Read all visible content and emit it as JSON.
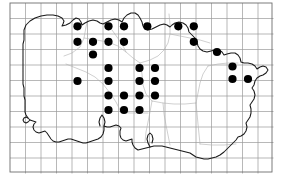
{
  "figure": {
    "kind": "distribution-map",
    "region": "Jersey",
    "width": 283,
    "height": 183,
    "background_color": "#ffffff"
  },
  "chart_data": {
    "type": "scatter",
    "title": "",
    "subtitle": "",
    "xlabel": "",
    "ylabel": "",
    "grid": true,
    "legend_position": "none",
    "marker": {
      "shape": "circle",
      "fill_color": "#000000",
      "radius_px": 4.1,
      "count": 36
    },
    "grid_spec": {
      "origin_x": 10,
      "origin_y": 3,
      "cell_size": 15.5,
      "columns": 17,
      "rows": 11,
      "line_color": "#9a9a9a",
      "border_color": "#6e6e6e"
    },
    "axis_ranges": {
      "xlim": [
        0,
        17
      ],
      "ylim": [
        0,
        11
      ]
    },
    "tick_labels": {
      "x": [],
      "y": []
    },
    "annotations": [],
    "records_grid_cells": [
      [
        4,
        1
      ],
      [
        6,
        1
      ],
      [
        7,
        1
      ],
      [
        9,
        1
      ],
      [
        11,
        1
      ],
      [
        12,
        1
      ],
      [
        4,
        2
      ],
      [
        5,
        2
      ],
      [
        6,
        2
      ],
      [
        7,
        2
      ],
      [
        12,
        2
      ],
      [
        5,
        3
      ],
      [
        14,
        3
      ],
      [
        6,
        4
      ],
      [
        8,
        4
      ],
      [
        9,
        4
      ],
      [
        15,
        4
      ],
      [
        4,
        5
      ],
      [
        6,
        5
      ],
      [
        8,
        5
      ],
      [
        9,
        5
      ],
      [
        15,
        5
      ],
      [
        16,
        5
      ],
      [
        6,
        6
      ],
      [
        7,
        6
      ],
      [
        8,
        6
      ],
      [
        9,
        6
      ],
      [
        6,
        7
      ],
      [
        7,
        7
      ],
      [
        8,
        7
      ]
    ],
    "points_px": [
      {
        "x": 77.5,
        "y": 26.3
      },
      {
        "x": 108.5,
        "y": 26.3
      },
      {
        "x": 124.0,
        "y": 26.3
      },
      {
        "x": 147.3,
        "y": 26.3
      },
      {
        "x": 178.3,
        "y": 26.3
      },
      {
        "x": 193.8,
        "y": 26.3
      },
      {
        "x": 77.5,
        "y": 41.8
      },
      {
        "x": 93.0,
        "y": 41.8
      },
      {
        "x": 108.5,
        "y": 41.8
      },
      {
        "x": 124.0,
        "y": 41.8
      },
      {
        "x": 193.8,
        "y": 41.8
      },
      {
        "x": 93.0,
        "y": 54.5
      },
      {
        "x": 217.0,
        "y": 52.0
      },
      {
        "x": 108.5,
        "y": 68.0
      },
      {
        "x": 139.5,
        "y": 68.0
      },
      {
        "x": 155.0,
        "y": 68.0
      },
      {
        "x": 232.5,
        "y": 66.5
      },
      {
        "x": 77.5,
        "y": 81.0
      },
      {
        "x": 108.5,
        "y": 81.0
      },
      {
        "x": 139.5,
        "y": 81.0
      },
      {
        "x": 155.0,
        "y": 81.0
      },
      {
        "x": 232.5,
        "y": 79.0
      },
      {
        "x": 248.0,
        "y": 79.0
      },
      {
        "x": 108.5,
        "y": 95.5
      },
      {
        "x": 124.0,
        "y": 95.5
      },
      {
        "x": 139.5,
        "y": 95.5
      },
      {
        "x": 155.0,
        "y": 95.5
      },
      {
        "x": 108.5,
        "y": 110.0
      },
      {
        "x": 124.0,
        "y": 110.0
      },
      {
        "x": 139.5,
        "y": 110.0
      }
    ],
    "series": [
      {
        "name": "records",
        "values": [
          1,
          1,
          1,
          1,
          1,
          1,
          1,
          1,
          1,
          1,
          1,
          1,
          1,
          1,
          1,
          1,
          1,
          1,
          1,
          1,
          1,
          1,
          1,
          1,
          1,
          1,
          1,
          1,
          1,
          1
        ]
      }
    ]
  }
}
